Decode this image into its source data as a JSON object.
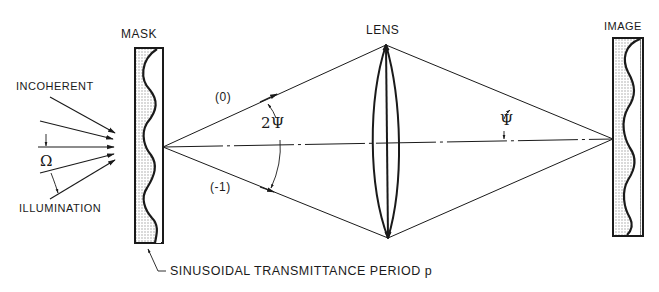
{
  "diagram": {
    "labels": {
      "mask": "MASK",
      "lens": "LENS",
      "image": "IMAGE",
      "incoherent": "INCOHERENT",
      "illumination": "ILLUMINATION",
      "omega": "Ω",
      "order_zero": "(0)",
      "order_minus_one": "(-1)",
      "two_psi": "2Ψ",
      "psi": "Ψ",
      "caption": "SINUSOIDAL TRANSMITTANCE PERIOD p"
    },
    "colors": {
      "ink": "#1a1a1a",
      "fill": "#d8d8d8",
      "background": "#ffffff"
    }
  }
}
